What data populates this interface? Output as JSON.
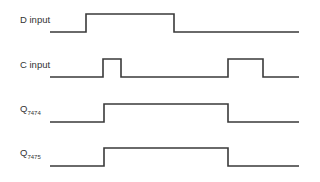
{
  "diagram": {
    "type": "timing-diagram",
    "line_color": "#3a3a3a",
    "background": "#ffffff",
    "x_start": 50,
    "x_end": 299,
    "signals": [
      {
        "name": "D input",
        "label_main": "D input",
        "label_sub": "",
        "label_x": 20,
        "label_y": 14,
        "low_y": 32,
        "high_y": 14,
        "transitions": [
          86,
          174
        ],
        "initial": "low",
        "points": "50,32 86,32 86,14 174,14 174,32 299,32"
      },
      {
        "name": "C input",
        "label_main": "C input",
        "label_sub": "",
        "label_x": 20,
        "label_y": 59,
        "low_y": 77,
        "high_y": 59,
        "transitions": [
          103,
          121,
          228,
          263
        ],
        "initial": "low",
        "points": "50,77 103,77 103,59 121,59 121,77 228,77 228,59 263,59 263,77 299,77"
      },
      {
        "name": "Q7474",
        "label_main": "Q",
        "label_sub": "7474",
        "label_x": 20,
        "label_y": 105,
        "low_y": 122,
        "high_y": 104,
        "transitions": [
          104,
          228
        ],
        "initial": "low",
        "points": "50,122 104,122 104,104 228,104 228,122 299,122"
      },
      {
        "name": "Q7475",
        "label_main": "Q",
        "label_sub": "7475",
        "label_x": 20,
        "label_y": 149,
        "low_y": 166,
        "high_y": 148,
        "transitions": [
          104,
          228
        ],
        "initial": "low",
        "points": "50,166 104,166 104,148 228,148 228,166 299,166"
      }
    ]
  }
}
